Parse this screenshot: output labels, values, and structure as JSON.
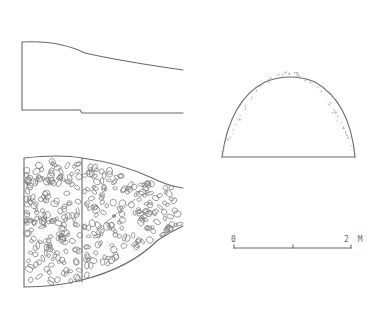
{
  "figure": {
    "type": "archaeological-drawing",
    "views": [
      {
        "name": "longitudinal-section",
        "position": "top-left"
      },
      {
        "name": "plan-view-stone-fill",
        "position": "bottom-left"
      },
      {
        "name": "cross-section-arch",
        "position": "top-right"
      },
      {
        "name": "scale-bar",
        "position": "bottom-right"
      }
    ],
    "scale_bar": {
      "start_label": "0",
      "end_label": "2 M",
      "unit": "M",
      "length": 2
    },
    "colors": {
      "ink": "#6a6a6a",
      "background": "#ffffff"
    }
  }
}
